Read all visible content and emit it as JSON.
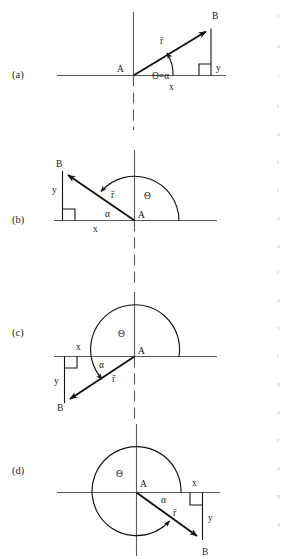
{
  "figure": {
    "panels": [
      {
        "id": "a",
        "label": "(a)",
        "quadrant": "first",
        "origin_label": "A",
        "tip_label": "B",
        "vector_label": "r̄",
        "angle_label": "Θ=α",
        "x_label": "x",
        "y_label": "y",
        "theta_label": "Θ",
        "alpha_label": "α"
      },
      {
        "id": "b",
        "label": "(b)",
        "quadrant": "second",
        "origin_label": "A",
        "tip_label": "B",
        "vector_label": "r̄",
        "angle_label": "α",
        "x_label": "x",
        "y_label": "y",
        "theta_label": "Θ",
        "alpha_label": "α"
      },
      {
        "id": "c",
        "label": "(c)",
        "quadrant": "third",
        "origin_label": "A",
        "tip_label": "B",
        "vector_label": "r̄",
        "angle_label": "α",
        "x_label": "x",
        "y_label": "y",
        "theta_label": "Θ",
        "alpha_label": "α"
      },
      {
        "id": "d",
        "label": "(d)",
        "quadrant": "fourth",
        "origin_label": "A",
        "tip_label": "B",
        "vector_label": "r̄",
        "angle_label": "α",
        "x_label": "x",
        "y_label": "y",
        "theta_label": "Θ",
        "alpha_label": "α"
      }
    ],
    "colors": {
      "ink": "#131313",
      "axis": "#5a5a5a",
      "background": "#ffffff"
    }
  },
  "chart_data": {
    "type": "diagram",
    "panels": [
      {
        "id": "a",
        "origin": [
          133,
          75
        ],
        "tip": [
          211,
          28
        ],
        "theta_deg": 31,
        "alpha_deg": 31,
        "x_component_sign": "+",
        "y_component_sign": "+"
      },
      {
        "id": "b",
        "origin": [
          134,
          220
        ],
        "tip": [
          63,
          171
        ],
        "theta_deg": 145,
        "alpha_deg": 35,
        "x_component_sign": "-",
        "y_component_sign": "+"
      },
      {
        "id": "c",
        "origin": [
          134,
          356
        ],
        "tip": [
          64,
          403
        ],
        "theta_deg": 214,
        "alpha_deg": 34,
        "x_component_sign": "-",
        "y_component_sign": "-"
      },
      {
        "id": "d",
        "origin": [
          136,
          492
        ],
        "tip": [
          203,
          540
        ],
        "theta_deg": 324,
        "alpha_deg": 36,
        "x_component_sign": "+",
        "y_component_sign": "-"
      }
    ]
  },
  "edge_artifacts": [
    {
      "top": 12,
      "text": "f"
    },
    {
      "top": 42,
      "text": "s"
    },
    {
      "top": 72,
      "text": "c"
    },
    {
      "top": 102,
      "text": "t"
    },
    {
      "top": 130,
      "text": "s"
    },
    {
      "top": 158,
      "text": "t"
    },
    {
      "top": 186,
      "text": "l"
    },
    {
      "top": 214,
      "text": "e"
    },
    {
      "top": 242,
      "text": "a"
    },
    {
      "top": 268,
      "text": "i"
    },
    {
      "top": 296,
      "text": "n"
    },
    {
      "top": 324,
      "text": "o"
    },
    {
      "top": 352,
      "text": "t"
    },
    {
      "top": 380,
      "text": "h"
    },
    {
      "top": 408,
      "text": "e"
    },
    {
      "top": 436,
      "text": "r"
    },
    {
      "top": 464,
      "text": "a"
    },
    {
      "top": 492,
      "text": "n"
    },
    {
      "top": 520,
      "text": "g"
    }
  ]
}
